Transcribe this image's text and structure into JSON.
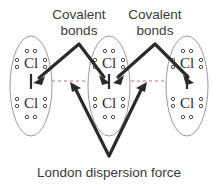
{
  "figure": {
    "background_color": "#ffffff",
    "ink_color": "#2b2b2b",
    "ellipse_color": "#9a9a9a",
    "dashed_color": "#b0708a"
  },
  "labels": {
    "covalent_left": "Covalent\nbonds",
    "covalent_left_line1": "Covalent",
    "covalent_left_line2": "bonds",
    "covalent_right_line1": "Covalent",
    "covalent_right_line2": "bonds",
    "dispersion": "London dispersion force"
  },
  "molecules": [
    {
      "id": "molecule-left",
      "formula": "Cl2",
      "atoms": [
        {
          "symbol": "Cl",
          "position": "top",
          "lone_pairs": [
            "top",
            "left",
            "right"
          ]
        },
        {
          "symbol": "Cl",
          "position": "bottom",
          "lone_pairs": [
            "bottom",
            "left",
            "right"
          ]
        }
      ],
      "bond": {
        "type": "covalent single bond",
        "notation": "|"
      }
    },
    {
      "id": "molecule-center",
      "formula": "Cl2",
      "atoms": [
        {
          "symbol": "Cl",
          "position": "top",
          "lone_pairs": [
            "top",
            "left",
            "right"
          ]
        },
        {
          "symbol": "Cl",
          "position": "bottom",
          "lone_pairs": [
            "bottom",
            "left",
            "right"
          ]
        }
      ],
      "bond": {
        "type": "covalent single bond",
        "notation": "|"
      }
    },
    {
      "id": "molecule-right",
      "formula": "Cl2",
      "atoms": [
        {
          "symbol": "Cl",
          "position": "top",
          "lone_pairs": [
            "top",
            "left",
            "right"
          ]
        },
        {
          "symbol": "Cl",
          "position": "bottom",
          "lone_pairs": [
            "bottom",
            "left",
            "right"
          ]
        }
      ],
      "bond": {
        "type": "covalent single bond",
        "notation": "|"
      }
    }
  ],
  "annotations": [
    {
      "id": "covalent-left-pointer",
      "label": "Covalent bonds",
      "targets": [
        "molecule-left bond",
        "molecule-center bond"
      ],
      "shape": "inverted-v with two arrowheads"
    },
    {
      "id": "covalent-right-pointer",
      "label": "Covalent bonds",
      "targets": [
        "molecule-center bond",
        "molecule-right bond"
      ],
      "shape": "inverted-v with two arrowheads"
    },
    {
      "id": "dispersion-pointer",
      "label": "London dispersion force",
      "targets": [
        "gap between molecule-left and molecule-center",
        "gap between molecule-center and molecule-right"
      ],
      "shape": "v with two arrowheads"
    }
  ],
  "intermolecular": {
    "type": "London dispersion force",
    "representation": "horizontal dashed lines between molecules",
    "count": 2
  }
}
